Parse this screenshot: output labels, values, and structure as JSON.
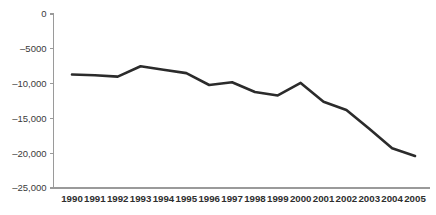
{
  "chart_data": {
    "type": "line",
    "title": "",
    "subtitle": "",
    "xlabel": "",
    "ylabel": "",
    "grid": false,
    "legend": false,
    "legend_position": "none",
    "line_color": "#2b2b2b",
    "axis_color": "#9a9a9a",
    "background_color": "#ffffff",
    "categories": [
      "1990",
      "1991",
      "1992",
      "1993",
      "1994",
      "1995",
      "1996",
      "1997",
      "1998",
      "1999",
      "2000",
      "2001",
      "2002",
      "2003",
      "2004",
      "2005"
    ],
    "values": [
      -8700,
      -8800,
      -9000,
      -7500,
      -8000,
      -8500,
      -10200,
      -9800,
      -11200,
      -11700,
      -9900,
      -12600,
      -13800,
      -16500,
      -19300,
      -20400
    ],
    "series": [
      {
        "name": "",
        "values": [
          -8700,
          -8800,
          -9000,
          -7500,
          -8000,
          -8500,
          -10200,
          -9800,
          -11200,
          -11700,
          -9900,
          -12600,
          -13800,
          -16500,
          -19300,
          -20400
        ]
      }
    ],
    "ylim": [
      -25000,
      0
    ],
    "xlim": [
      "1990",
      "2005"
    ],
    "y_ticks": [
      0,
      -5000,
      -10000,
      -15000,
      -20000,
      -25000
    ],
    "y_tick_labels": [
      "0",
      "–5000",
      "–10,000",
      "–15,000",
      "–20,000",
      "–25,000"
    ],
    "x_tick_labels": [
      "1990",
      "1991",
      "1992",
      "1993",
      "1994",
      "1995",
      "1996",
      "1997",
      "1998",
      "1999",
      "2000",
      "2001",
      "2002",
      "2003",
      "2004",
      "2005"
    ]
  }
}
